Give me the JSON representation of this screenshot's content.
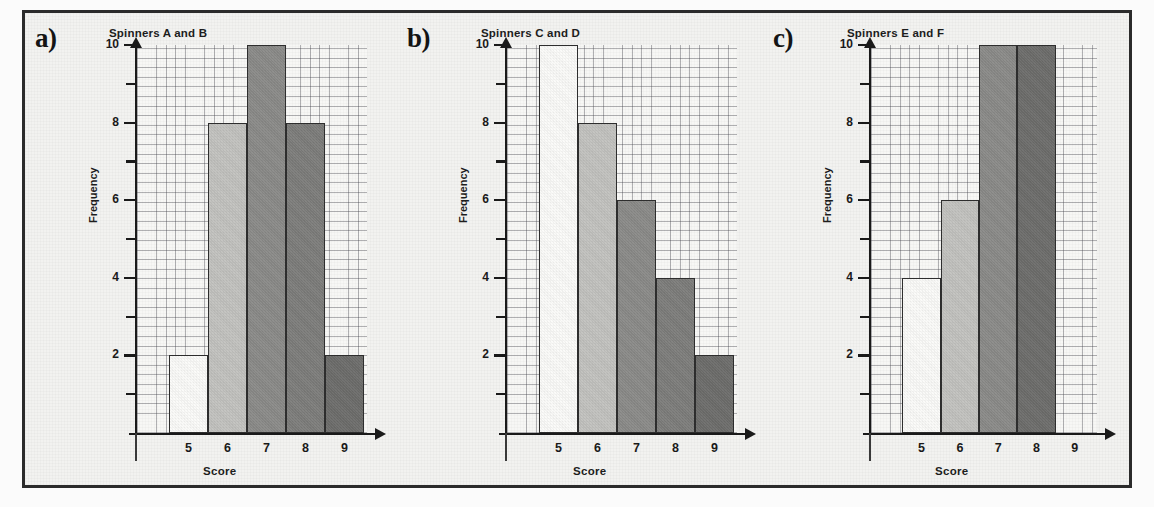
{
  "figure": {
    "background_color": "#f2f2f0",
    "frame_color": "#2b2b2b"
  },
  "panels": [
    {
      "label": "a)",
      "title": "Spinners A and B",
      "xlabel": "Score",
      "ylabel": "Frequency"
    },
    {
      "label": "b)",
      "title": "Spinners C and D",
      "xlabel": "Score",
      "ylabel": "Frequency"
    },
    {
      "label": "c)",
      "title": "Spinners E and F",
      "xlabel": "Score",
      "ylabel": "Frequency"
    }
  ],
  "axis": {
    "y_tick_labels": [
      "10",
      "8",
      "6",
      "4",
      "2"
    ],
    "y_tick_values": [
      10,
      8,
      6,
      4,
      2
    ],
    "y_minor_values": [
      9,
      7,
      5,
      3,
      1
    ],
    "x_tick_labels": [
      "5",
      "6",
      "7",
      "8",
      "9"
    ]
  },
  "bar_colors": {
    "white": "#fbfbf9",
    "light_gray": "#c2c2bf",
    "medium_gray": "#8a8a88",
    "dark_gray": "#7d7d7b",
    "darker_gray": "#6d6d6b"
  },
  "chart_data": [
    {
      "type": "bar",
      "title": "Spinners A and B",
      "panel": "a)",
      "xlabel": "Score",
      "ylabel": "Frequency",
      "categories": [
        "5",
        "6",
        "7",
        "8",
        "9"
      ],
      "values": [
        2,
        8,
        10,
        8,
        2
      ],
      "colors": [
        "#fbfbf9",
        "#c2c2bf",
        "#8a8a88",
        "#7d7d7b",
        "#6d6d6b"
      ],
      "ylim": [
        0,
        10
      ],
      "yticks": [
        2,
        4,
        6,
        8,
        10
      ],
      "grid": true,
      "legend": "none"
    },
    {
      "type": "bar",
      "title": "Spinners C and D",
      "panel": "b)",
      "xlabel": "Score",
      "ylabel": "Frequency",
      "categories": [
        "5",
        "6",
        "7",
        "8",
        "9"
      ],
      "values": [
        10,
        8,
        6,
        4,
        2
      ],
      "colors": [
        "#fbfbf9",
        "#c2c2bf",
        "#8a8a88",
        "#7d7d7b",
        "#6d6d6b"
      ],
      "ylim": [
        0,
        10
      ],
      "yticks": [
        2,
        4,
        6,
        8,
        10
      ],
      "grid": true,
      "legend": "none"
    },
    {
      "type": "bar",
      "title": "Spinners E and F",
      "panel": "c)",
      "xlabel": "Score",
      "ylabel": "Frequency",
      "categories": [
        "5",
        "6",
        "7",
        "8",
        "9"
      ],
      "values": [
        4,
        6,
        10,
        10,
        0
      ],
      "colors": [
        "#fbfbf9",
        "#c2c2bf",
        "#8a8a88",
        "#6d6d6b",
        "#6d6d6b"
      ],
      "ylim": [
        0,
        10
      ],
      "yticks": [
        2,
        4,
        6,
        8,
        10
      ],
      "grid": true,
      "legend": "none"
    }
  ]
}
